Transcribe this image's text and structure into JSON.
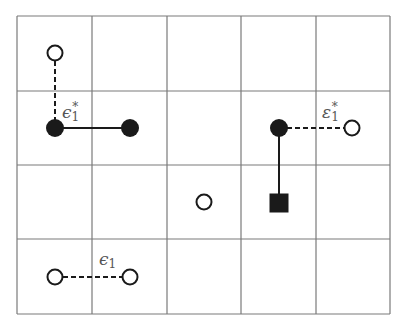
{
  "diagram": {
    "grid": {
      "columns": 5,
      "rows": 4,
      "x_lines": [
        17,
        92,
        167,
        241,
        316,
        390
      ],
      "y_lines": [
        16,
        91,
        165,
        239,
        314
      ],
      "line_color": "#7a7a7a"
    },
    "nodes": [
      {
        "id": "open-top-left",
        "type": "open-circle",
        "x": 55,
        "y": 53
      },
      {
        "id": "filled-left-a",
        "type": "filled-circle",
        "x": 55,
        "y": 128
      },
      {
        "id": "filled-left-b",
        "type": "filled-circle",
        "x": 130,
        "y": 128
      },
      {
        "id": "filled-right",
        "type": "filled-circle",
        "x": 279,
        "y": 128
      },
      {
        "id": "open-right",
        "type": "open-circle",
        "x": 352,
        "y": 128
      },
      {
        "id": "open-center",
        "type": "open-circle",
        "x": 204,
        "y": 202
      },
      {
        "id": "filled-square",
        "type": "filled-square",
        "x": 279,
        "y": 203
      },
      {
        "id": "open-bottom-a",
        "type": "open-circle",
        "x": 55,
        "y": 277
      },
      {
        "id": "open-bottom-b",
        "type": "open-circle",
        "x": 130,
        "y": 277
      }
    ],
    "edges": [
      {
        "from": "open-top-left",
        "to": "filled-left-a",
        "style": "dashed"
      },
      {
        "from": "filled-left-a",
        "to": "filled-left-b",
        "style": "solid"
      },
      {
        "from": "filled-right",
        "to": "open-right",
        "style": "dashed"
      },
      {
        "from": "filled-right",
        "to": "filled-square",
        "style": "solid"
      },
      {
        "from": "open-bottom-a",
        "to": "open-bottom-b",
        "style": "dashed"
      }
    ],
    "labels": [
      {
        "id": "label-epsilon-star-left",
        "symbol": "ϵ",
        "sub": "1",
        "sup": "*",
        "x": 62,
        "y": 101
      },
      {
        "id": "label-epsilon-star-right",
        "symbol": "ε",
        "sub": "1",
        "sup": "*",
        "x": 322,
        "y": 101
      },
      {
        "id": "label-epsilon-bottom",
        "symbol": "ϵ",
        "sub": "1",
        "sup": "",
        "x": 99,
        "y": 251
      }
    ],
    "colors": {
      "ink": "#1a1a1a",
      "label": "#555555",
      "background": "#ffffff"
    }
  }
}
